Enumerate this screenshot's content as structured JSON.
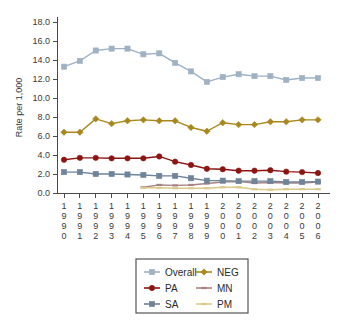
{
  "chart_data": {
    "type": "line",
    "title": "",
    "xlabel": "",
    "ylabel": "Rate per 1,000",
    "ylim": [
      0.0,
      18.0
    ],
    "ytick_step": 2.0,
    "yticks": [
      "0.0",
      "2.0",
      "4.0",
      "6.0",
      "8.0",
      "10.0",
      "12.0",
      "14.0",
      "16.0",
      "18.0"
    ],
    "grid": false,
    "legend_position": "bottom",
    "categories": [
      "1990",
      "1991",
      "1992",
      "1993",
      "1994",
      "1995",
      "1996",
      "1997",
      "1998",
      "1999",
      "2000",
      "2001",
      "2002",
      "2003",
      "2004",
      "2005",
      "2006"
    ],
    "series": [
      {
        "name": "Overall",
        "color": "#9fb2c4",
        "marker": "square",
        "values": [
          13.3,
          13.9,
          15.0,
          15.2,
          15.2,
          14.6,
          14.7,
          13.7,
          12.8,
          11.7,
          12.2,
          12.5,
          12.3,
          12.3,
          11.9,
          12.1,
          12.1
        ]
      },
      {
        "name": "NEG",
        "color": "#a8881e",
        "marker": "diamond",
        "values": [
          6.4,
          6.4,
          7.8,
          7.3,
          7.6,
          7.7,
          7.6,
          7.6,
          6.9,
          6.5,
          7.4,
          7.2,
          7.2,
          7.5,
          7.5,
          7.7,
          7.7
        ]
      },
      {
        "name": "PA",
        "color": "#8c1512",
        "marker": "circle",
        "values": [
          3.5,
          3.7,
          3.7,
          3.65,
          3.65,
          3.65,
          3.85,
          3.3,
          2.95,
          2.55,
          2.5,
          2.35,
          2.35,
          2.4,
          2.25,
          2.2,
          2.1
        ]
      },
      {
        "name": "MN",
        "color": "#a98284",
        "marker": "line",
        "values": [
          null,
          null,
          null,
          null,
          null,
          0.6,
          0.85,
          0.8,
          0.85,
          1.0,
          1.15,
          1.2,
          1.05,
          1.1,
          1.05,
          1.05,
          1.15
        ]
      },
      {
        "name": "SA",
        "color": "#6e8499",
        "marker": "square",
        "values": [
          2.2,
          2.2,
          2.0,
          2.0,
          1.95,
          1.9,
          1.8,
          1.8,
          1.55,
          1.3,
          1.3,
          1.25,
          1.25,
          1.25,
          1.15,
          1.15,
          1.2
        ]
      },
      {
        "name": "PM",
        "color": "#dcc98a",
        "marker": "line",
        "values": [
          null,
          null,
          null,
          null,
          null,
          0.55,
          0.55,
          0.5,
          0.5,
          0.5,
          0.6,
          0.6,
          0.4,
          0.35,
          0.4,
          0.4,
          0.4
        ]
      }
    ]
  },
  "legend": {
    "entries": [
      {
        "label": "Overall",
        "color": "#9fb2c4",
        "marker": "square"
      },
      {
        "label": "NEG",
        "color": "#a8881e",
        "marker": "diamond"
      },
      {
        "label": "PA",
        "color": "#8c1512",
        "marker": "circle"
      },
      {
        "label": "MN",
        "color": "#a98284",
        "marker": "line"
      },
      {
        "label": "SA",
        "color": "#6e8499",
        "marker": "square"
      },
      {
        "label": "PM",
        "color": "#dcc98a",
        "marker": "line"
      }
    ]
  }
}
